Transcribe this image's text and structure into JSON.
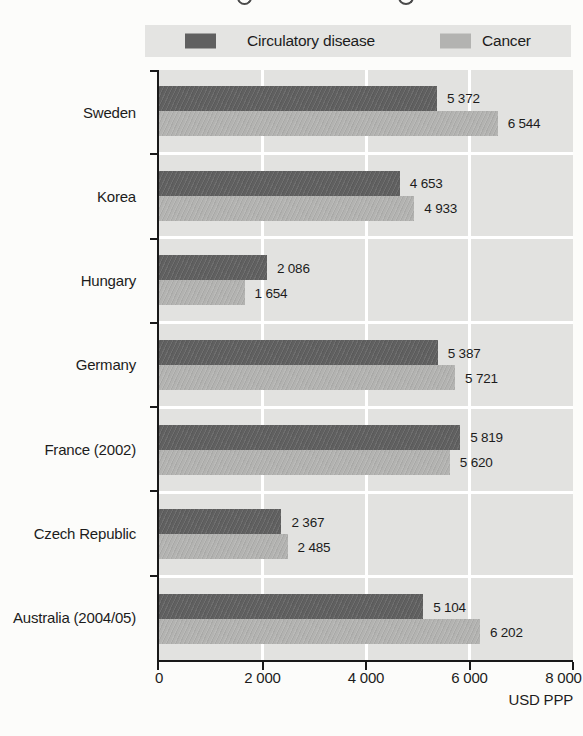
{
  "page": {
    "background": "#fcfcfa"
  },
  "legend": {
    "background": "#e4e4e2",
    "items": [
      {
        "label": "Circulatory disease",
        "color": "#606060"
      },
      {
        "label": "Cancer",
        "color": "#b3b3b1"
      }
    ]
  },
  "chart_data": {
    "type": "bar",
    "orientation": "horizontal",
    "categories": [
      "Sweden",
      "Korea",
      "Hungary",
      "Germany",
      "France (2002)",
      "Czech Republic",
      "Australia (2004/05)"
    ],
    "series": [
      {
        "name": "Circulatory disease",
        "color": "#606060",
        "values": [
          5372,
          4653,
          2086,
          5387,
          5819,
          2367,
          5104
        ],
        "value_labels": [
          "5 372",
          "4 653",
          "2 086",
          "5 387",
          "5 819",
          "2 367",
          "5 104"
        ]
      },
      {
        "name": "Cancer",
        "color": "#b3b3b1",
        "values": [
          6544,
          4933,
          1654,
          5721,
          5620,
          2485,
          6202
        ],
        "value_labels": [
          "6 544",
          "4 933",
          "1 654",
          "5 721",
          "5 620",
          "2 485",
          "6 202"
        ]
      }
    ],
    "xlabel": "USD PPP",
    "xlim": [
      0,
      8000
    ],
    "xticks": [
      2000,
      4000,
      6000,
      8000
    ],
    "xtick_labels": [
      "0",
      "2 000",
      "4 000",
      "6 000",
      "8 000"
    ],
    "legend_position": "top",
    "plot_background": "#e2e2e0",
    "gridline_color": "#ffffff",
    "grid": "vertical"
  }
}
